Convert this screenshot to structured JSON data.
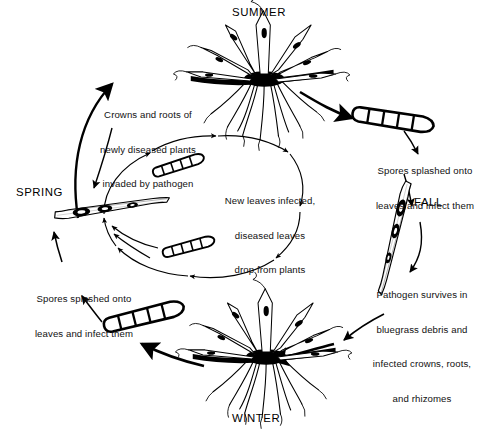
{
  "diagram": {
    "type": "seasonal-disease-cycle",
    "colors": {
      "ink": "#000000",
      "background": "#ffffff",
      "text": "#111111"
    }
  },
  "seasons": {
    "summer": "SUMMER",
    "fall": "FALL",
    "winter": "WINTER",
    "spring": "SPRING"
  },
  "labels": {
    "crowns_roots": {
      "line1": "Crowns and roots of",
      "line2": "newly diseased plants",
      "line3": "invaded by pathogen"
    },
    "spores_top": {
      "line1": "Spores splashed onto",
      "line2": "leaves and infect them"
    },
    "pathogen_survives": {
      "line1": "Pathogen survives in",
      "line2": "bluegrass debris and",
      "line3": "infected crowns, roots,",
      "line4": "and rhizomes"
    },
    "spores_bottom": {
      "line1": "Spores splashed onto",
      "line2": "leaves and infect them"
    },
    "new_leaves": {
      "line1": "New leaves infected,",
      "line2": "diseased leaves",
      "line3": "drop from plants"
    }
  },
  "elements": {
    "summer_plant": "grass-plant-crown-roots",
    "winter_plant": "grass-plant-crown-roots",
    "spring_leaf": "infected-leaf-blade",
    "fall_leaf": "infected-leaf-blade",
    "spore_top_right": "septate-spore",
    "spore_bottom_left": "septate-spore",
    "spore_inner_upper": "septate-spore-small",
    "spore_inner_lower": "septate-spore-small",
    "inner_cycle_arrows": "clockwise-arrow-ellipse",
    "outer_cycle_arrows": "clockwise-arc-arrows"
  }
}
